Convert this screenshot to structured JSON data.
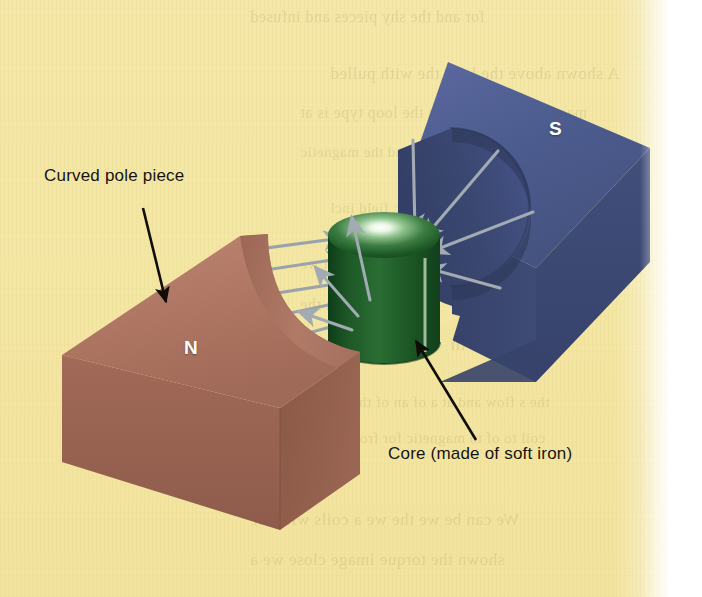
{
  "figure": {
    "kind": "magnetic-field-diagram",
    "background_color": "#f4e7a5",
    "labels": {
      "curved_pole_piece": "Curved pole piece",
      "core": "Core (made of soft iron)"
    },
    "poles": {
      "north_letter": "N",
      "south_letter": "S"
    },
    "parts": [
      {
        "name": "north-pole-piece",
        "letter": "N",
        "color": "#a8705e",
        "top_color": "#b8806c",
        "front_color": "#9a6452",
        "side_color": "#8a5948",
        "description": "Curved (concave) pole piece, left, brown block"
      },
      {
        "name": "south-pole-piece",
        "letter": "S",
        "color": "#4a5a86",
        "top_color": "#55649a",
        "front_color": "#3c4a73",
        "side_color": "#35406a",
        "description": "Curved (concave) pole piece, right, blue block"
      },
      {
        "name": "soft-iron-core",
        "color": "#1f5a28",
        "highlight_color": "#f2fbf0",
        "description": "Green cylinder between the pole pieces"
      }
    ],
    "field_lines": {
      "color": "#9aa3ab",
      "arrow_color": "#9aa3ab",
      "direction": "from N pole piece, through core, to S pole piece",
      "count": 10
    },
    "bleed_through_lines": [
      {
        "text": "for and the shy pieces and infused",
        "x": 250,
        "y": 8,
        "size": 16
      },
      {
        "text": "A  shown above the loop the with pulled",
        "x": 330,
        "y": 64,
        "size": 17
      },
      {
        "text": "magnetic of moment in the loop type is at",
        "x": 300,
        "y": 104,
        "size": 16
      },
      {
        "text": "a torque that this second the magnetic",
        "x": 300,
        "y": 144,
        "size": 15
      },
      {
        "text": "the contact of magnetic field incl",
        "x": 330,
        "y": 200,
        "size": 15
      },
      {
        "text": "and the and at the current and that we",
        "x": 300,
        "y": 256,
        "size": 15
      },
      {
        "text": "of sideline in the current force with the",
        "x": 300,
        "y": 296,
        "size": 16
      },
      {
        "text": "remains the of magnetic the loop the",
        "x": 250,
        "y": 334,
        "size": 18
      },
      {
        "text": "the s flow and at a of an of the magnet",
        "x": 300,
        "y": 394,
        "size": 15
      },
      {
        "text": "coil to of to magnetic for from the for",
        "x": 300,
        "y": 430,
        "size": 15
      },
      {
        "text": "We  can be we  the we a coils with the",
        "x": 250,
        "y": 510,
        "size": 17
      },
      {
        "text": "shown the torque image close we  a",
        "x": 250,
        "y": 550,
        "size": 17
      }
    ]
  }
}
